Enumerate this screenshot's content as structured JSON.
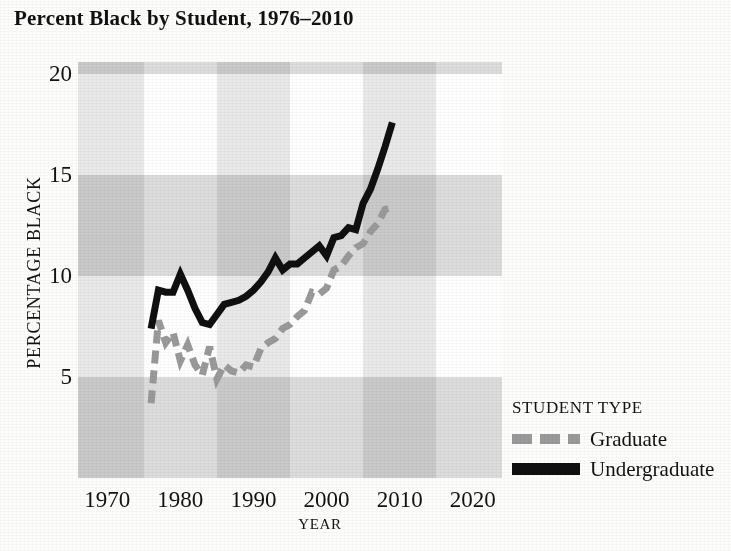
{
  "chart_data": {
    "type": "line",
    "title": "Percent Black by Student, 1976–2010",
    "xlabel": "YEAR",
    "ylabel": "PERCENTAGE BLACK",
    "xlim": [
      1966,
      2024
    ],
    "ylim": [
      0,
      20.6
    ],
    "xticks": [
      1970,
      1980,
      1990,
      2000,
      2010,
      2020
    ],
    "xticklabels": [
      "1970",
      "1980",
      "1990",
      "2000",
      "2010",
      "2020"
    ],
    "yticks": [
      5,
      10,
      15,
      20
    ],
    "yticklabels": [
      "5",
      "10",
      "15",
      "20"
    ],
    "grid": false,
    "background_bands": true,
    "legend": {
      "position": "right",
      "title": "STUDENT TYPE",
      "entries": [
        {
          "name": "Graduate",
          "style": "dashed",
          "color": "#9a9a9a"
        },
        {
          "name": "Undergraduate",
          "style": "solid",
          "color": "#101010"
        }
      ]
    },
    "series": [
      {
        "name": "Graduate",
        "style": "dashed",
        "color": "#9a9a9a",
        "x": [
          1976,
          1977,
          1978,
          1979,
          1980,
          1981,
          1982,
          1983,
          1984,
          1985,
          1986,
          1987,
          1988,
          1989,
          1990,
          1991,
          1992,
          1993,
          1994,
          1995,
          1996,
          1997,
          1998,
          1999,
          2000,
          2001,
          2002,
          2003,
          2004,
          2005,
          2006,
          2007,
          2008,
          2009
        ],
        "values": [
          3.7,
          7.8,
          6.7,
          7.2,
          5.8,
          6.6,
          5.6,
          5.1,
          6.5,
          4.9,
          5.6,
          5.3,
          5.2,
          5.6,
          5.5,
          6.4,
          6.7,
          6.9,
          7.4,
          7.6,
          8.0,
          8.3,
          9.2,
          9.1,
          9.4,
          10.3,
          10.5,
          11.0,
          11.4,
          11.6,
          12.2,
          12.6,
          13.3,
          13.4
        ]
      },
      {
        "name": "Undergraduate",
        "style": "solid",
        "color": "#101010",
        "x": [
          1976,
          1977,
          1978,
          1979,
          1980,
          1981,
          1982,
          1983,
          1984,
          1985,
          1986,
          1987,
          1988,
          1989,
          1990,
          1991,
          1992,
          1993,
          1994,
          1995,
          1996,
          1997,
          1998,
          1999,
          2000,
          2001,
          2002,
          2003,
          2004,
          2005,
          2006,
          2007,
          2008,
          2009
        ],
        "values": [
          7.4,
          9.3,
          9.2,
          9.2,
          10.1,
          9.3,
          8.4,
          7.7,
          7.6,
          8.1,
          8.6,
          8.7,
          8.8,
          9.0,
          9.3,
          9.7,
          10.2,
          10.9,
          10.3,
          10.6,
          10.6,
          10.9,
          11.2,
          11.5,
          11.0,
          11.9,
          12.0,
          12.4,
          12.3,
          13.6,
          14.3,
          15.3,
          16.4,
          17.6
        ]
      }
    ]
  }
}
